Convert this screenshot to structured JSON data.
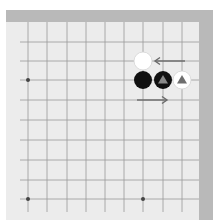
{
  "diagram": {
    "type": "go-board-fragment",
    "board_color": "#ececec",
    "edge_color": "#b9b9b9",
    "line_color": "#9a9a9a",
    "grid": {
      "x": [
        28,
        47,
        67,
        86,
        105,
        124,
        143,
        163,
        182
      ],
      "y": [
        42,
        61,
        80,
        100,
        120,
        140,
        160,
        180,
        199
      ]
    },
    "hoshi": [
      {
        "x": 28,
        "y": 80
      },
      {
        "x": 28,
        "y": 199
      },
      {
        "x": 143,
        "y": 199
      }
    ],
    "stones": [
      {
        "color": "white",
        "x": 143,
        "y": 61,
        "marker": "none"
      },
      {
        "color": "black",
        "x": 143,
        "y": 80,
        "marker": "none"
      },
      {
        "color": "black",
        "x": 163,
        "y": 80,
        "marker": "triangle"
      },
      {
        "color": "white",
        "x": 182,
        "y": 80,
        "marker": "triangle"
      }
    ],
    "arrows": [
      {
        "direction": "left",
        "x1": 185,
        "y1": 61,
        "x2": 155,
        "y2": 61
      },
      {
        "direction": "right",
        "x1": 137,
        "y1": 100,
        "x2": 167,
        "y2": 100
      }
    ]
  }
}
